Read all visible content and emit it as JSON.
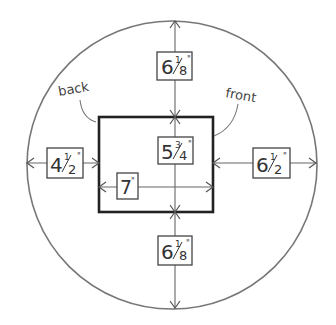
{
  "diagram": {
    "colors": {
      "stroke": "#6a6a6a",
      "rect_stroke": "#222222",
      "box_stroke": "#444444",
      "text": "#333333"
    },
    "labels": {
      "back": "back",
      "front": "front"
    },
    "measurements": {
      "top": {
        "whole": "6",
        "num": "1",
        "den": "8",
        "unit": "\""
      },
      "bottom": {
        "whole": "6",
        "num": "1",
        "den": "8",
        "unit": "\""
      },
      "left": {
        "whole": "4",
        "num": "1",
        "den": "2",
        "unit": "\""
      },
      "right": {
        "whole": "6",
        "num": "1",
        "den": "2",
        "unit": "\""
      },
      "height": {
        "whole": "5",
        "num": "3",
        "den": "4",
        "unit": "\""
      },
      "width": {
        "whole": "7",
        "unit": "\""
      }
    }
  }
}
